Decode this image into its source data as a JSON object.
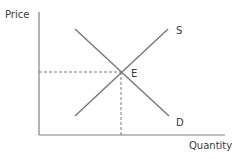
{
  "diagram": {
    "type": "supply-demand",
    "y_axis_label": "Price",
    "x_axis_label": "Quantity",
    "curves": [
      {
        "id": "supply",
        "label": "S",
        "slope": "upward"
      },
      {
        "id": "demand",
        "label": "D",
        "slope": "downward"
      }
    ],
    "equilibrium_label": "E",
    "colors": {
      "axis": "#808080",
      "curve": "#7a7a7a",
      "text": "#3a3a3a"
    }
  }
}
